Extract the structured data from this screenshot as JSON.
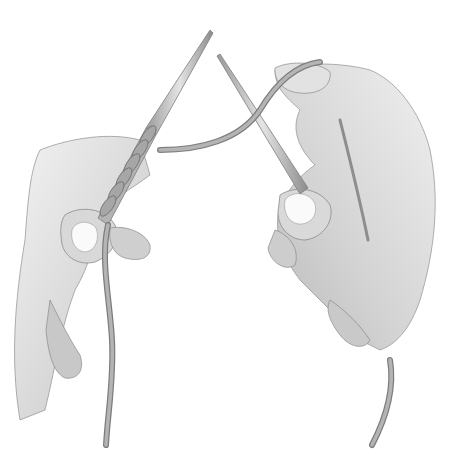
{
  "illustration": {
    "subject": "hands knitting with two needles",
    "colors": {
      "background": "#ffffff",
      "skin_light": "#eeeeee",
      "skin_mid": "#d4d4d4",
      "skin_shadow": "#b8b8b8",
      "outline": "#8a8a8a",
      "needle": "#a9a9a9",
      "needle_highlight": "#e6e6e6",
      "yarn": "#9c9c9c",
      "nail": "#fafafa"
    }
  }
}
